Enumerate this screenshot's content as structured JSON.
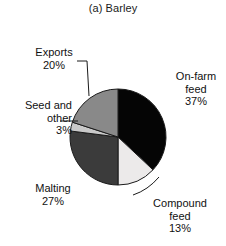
{
  "chart_data": {
    "type": "pie",
    "title": "(a) Barley",
    "xlabel": "",
    "ylabel": "",
    "legend_position": "none",
    "grid": false,
    "categories": [
      "On-farm feed",
      "Compound feed",
      "Malting",
      "Seed and other",
      "Exports"
    ],
    "values": [
      37,
      13,
      27,
      3,
      20
    ],
    "value_suffix": "%",
    "start_angle_deg": 0,
    "direction": "clockwise",
    "colors": [
      "#050505",
      "#eceaea",
      "#3b3b3b",
      "#c9c9c9",
      "#898989"
    ],
    "slices": [
      {
        "label": "On-farm feed",
        "value": 37,
        "value_text": "37%",
        "color": "#050505"
      },
      {
        "label": "Compound feed",
        "value": 13,
        "value_text": "13%",
        "color": "#eceaea"
      },
      {
        "label": "Malting",
        "value": 27,
        "value_text": "27%",
        "color": "#3b3b3b"
      },
      {
        "label": "Seed and other",
        "value": 3,
        "value_text": "3%",
        "color": "#c9c9c9"
      },
      {
        "label": "Exports",
        "value": 20,
        "value_text": "20%",
        "color": "#898989"
      }
    ]
  },
  "labels": {
    "onfarm": {
      "line1": "On-farm",
      "line2": "feed",
      "value": "37%"
    },
    "compound": {
      "line1": "Compound",
      "line2": "feed",
      "value": "13%"
    },
    "malting": {
      "line1": "Malting",
      "line2": "",
      "value": "27%"
    },
    "seed": {
      "line1": "Seed and",
      "line2": "other",
      "value": "3%"
    },
    "exports": {
      "line1": "Exports",
      "line2": "",
      "value": "20%"
    }
  },
  "style": {
    "background": "#ffffff",
    "text_color": "#111111",
    "outline_color": "#1a1a1a"
  }
}
